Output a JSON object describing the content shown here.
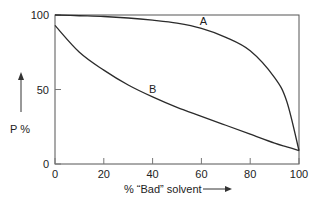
{
  "chart_data": {
    "type": "line",
    "title": "",
    "xlabel": "% “Bad” solvent",
    "ylabel": "P %",
    "xlim": [
      0,
      100
    ],
    "ylim": [
      0,
      100
    ],
    "x_ticks": [
      "0",
      "20",
      "40",
      "60",
      "80",
      "100"
    ],
    "y_ticks": [
      "0",
      "50",
      "100"
    ],
    "grid": false,
    "legend": "none (curves labeled inline)",
    "x": [
      0,
      10,
      20,
      30,
      40,
      50,
      60,
      70,
      80,
      90,
      95,
      100
    ],
    "series": [
      {
        "name": "A",
        "values": [
          100,
          99.5,
          99,
          98,
          96.5,
          94.5,
          91,
          85,
          76,
          58,
          42,
          9
        ]
      },
      {
        "name": "B",
        "values": [
          93,
          75,
          63,
          53,
          45,
          38,
          32,
          26,
          20,
          14,
          11.5,
          9
        ]
      }
    ],
    "annotations": [
      {
        "text": "A",
        "x": 60,
        "y": 90
      },
      {
        "text": "B",
        "x": 40,
        "y": 44
      }
    ]
  },
  "labels": {
    "x_axis": "% “Bad” solvent",
    "y_axis": "P %",
    "curve_a": "A",
    "curve_b": "B"
  },
  "colors": {
    "line": "#2b2b2b",
    "frame": "#555555",
    "text": "#222222"
  }
}
